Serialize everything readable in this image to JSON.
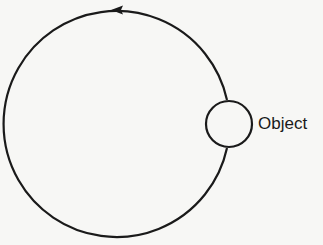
{
  "diagram": {
    "type": "circular-motion",
    "direction": "counterclockwise",
    "path": {
      "center_x": 118,
      "center_y": 123,
      "radius": 113,
      "stroke": "#1a1a1a"
    },
    "object": {
      "label": "Object",
      "center_x": 229,
      "center_y": 124,
      "radius": 23
    },
    "arrow": {
      "x": 118,
      "y": 10,
      "points": "left"
    }
  }
}
